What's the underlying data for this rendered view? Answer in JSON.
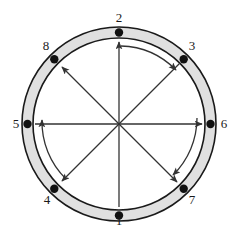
{
  "figure": {
    "type": "node-ring-diagram",
    "canvas": {
      "width": 244,
      "height": 229
    },
    "colors": {
      "ring_fill": "#e0e0e0",
      "ring_stroke": "#1a1a1a",
      "node_fill": "#111111",
      "arrow_stroke": "#333333",
      "label_color": "#1a1a1a",
      "background": "#ffffff"
    },
    "geometry": {
      "center_x": 119,
      "center_y": 124,
      "outer_radius": 97,
      "inner_radius": 86,
      "node_radius": 4.2,
      "node_ring_radius": 91.5,
      "label_radius": 116
    }
  },
  "nodes": [
    {
      "id": "node-1",
      "label": "1",
      "angle_deg": 90,
      "cx": 119,
      "cy": 215.5,
      "label_x": 119,
      "label_y": 221
    },
    {
      "id": "node-2",
      "label": "2",
      "angle_deg": 270,
      "cx": 119,
      "cy": 32.5,
      "label_x": 119,
      "label_y": 18
    },
    {
      "id": "node-3",
      "label": "3",
      "angle_deg": 315,
      "cx": 183.7,
      "cy": 59.3,
      "label_x": 192,
      "label_y": 46
    },
    {
      "id": "node-4",
      "label": "4",
      "angle_deg": 135,
      "cx": 54.3,
      "cy": 188.7,
      "label_x": 47,
      "label_y": 200
    },
    {
      "id": "node-5",
      "label": "5",
      "angle_deg": 180,
      "cx": 27.5,
      "cy": 124,
      "label_x": 16,
      "label_y": 124
    },
    {
      "id": "node-6",
      "label": "6",
      "angle_deg": 0,
      "cx": 210.5,
      "cy": 124,
      "label_x": 224,
      "label_y": 124
    },
    {
      "id": "node-7",
      "label": "7",
      "angle_deg": 45,
      "cx": 183.7,
      "cy": 188.7,
      "label_x": 192,
      "label_y": 200
    },
    {
      "id": "node-8",
      "label": "8",
      "angle_deg": 225,
      "cx": 54.3,
      "cy": 59.3,
      "label_x": 46,
      "label_y": 46
    }
  ],
  "radial_connections": [
    {
      "id": "spoke-center-to-1",
      "to_node": "1",
      "arrowhead": false,
      "x2": 119,
      "y2": 207
    },
    {
      "id": "spoke-center-to-2",
      "to_node": "2",
      "arrowhead": true,
      "x2": 119,
      "y2": 42
    },
    {
      "id": "spoke-center-to-3",
      "to_node": "3",
      "arrowhead": false,
      "x2": 180,
      "y2": 63
    },
    {
      "id": "spoke-center-to-4",
      "to_node": "4",
      "arrowhead": true,
      "x2": 62,
      "y2": 181
    },
    {
      "id": "spoke-center-to-5",
      "to_node": "5",
      "arrowhead": false,
      "x2": 35,
      "y2": 124
    },
    {
      "id": "spoke-center-to-6",
      "to_node": "6",
      "arrowhead": true,
      "x2": 202,
      "y2": 124
    },
    {
      "id": "spoke-center-to-7",
      "to_node": "7",
      "arrowhead": true,
      "x2": 177,
      "y2": 182
    },
    {
      "id": "spoke-center-to-8",
      "to_node": "8",
      "arrowhead": true,
      "x2": 62,
      "y2": 67
    }
  ],
  "arc_connections": [
    {
      "id": "arc-2-to-3",
      "from_node": "2",
      "to_node": "3",
      "direction": "clockwise",
      "arrowhead": true
    },
    {
      "id": "arc-6-to-7",
      "from_node": "6",
      "to_node": "7",
      "direction": "clockwise",
      "arrowhead": true
    },
    {
      "id": "arc-4-to-5",
      "from_node": "4",
      "to_node": "5",
      "direction": "counter-clockwise",
      "arrowhead": true
    }
  ]
}
